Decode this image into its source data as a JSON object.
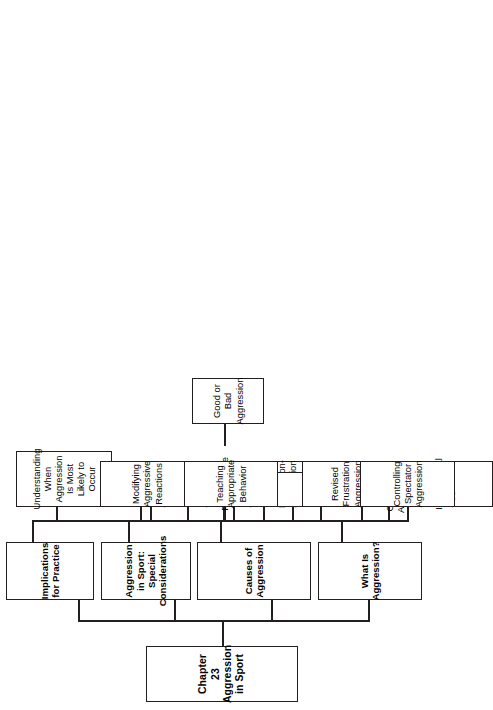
{
  "diagram": {
    "type": "tree",
    "orientation": "rotated-90-ccw",
    "line_color": "#231f20",
    "box_fill": "#ffffff",
    "root": {
      "id": "root",
      "line1": "Chapter 23",
      "line2": "Aggression in Sport"
    },
    "branches": [
      {
        "id": "what-is-aggression",
        "label": "What Is Aggression?",
        "children": [
          {
            "id": "criteria-for-aggression",
            "line1": "Criteria for Aggression",
            "line2": ""
          },
          {
            "id": "hostile-versus-instrumental-aggression",
            "line1": "Hostile Versus",
            "line2": "Instrumental Aggression"
          }
        ]
      },
      {
        "id": "causes-of-aggression",
        "label": "Causes of Aggression",
        "children": [
          {
            "id": "instinct-theory",
            "line1": "Instinct Theory",
            "line2": ""
          },
          {
            "id": "frustration-aggression-theory",
            "line1": "Frustration-Aggression",
            "line2": "Theory"
          },
          {
            "id": "social-learning-theory",
            "line1": "Social Learning Theory",
            "line2": ""
          },
          {
            "id": "revised-frustration-aggression-theory",
            "line1": "Revised Frustration",
            "line2": "Aggression Theory"
          }
        ]
      },
      {
        "id": "aggression-in-sport-special-considerations",
        "label_line1": "Aggression in Sport:",
        "label_line2": "Special Considerations",
        "children": [
          {
            "id": "spectators-and-aggression",
            "line1": "Spectators &",
            "line2": "Aggression"
          },
          {
            "id": "game-reasoning-and-aggression",
            "line1": "Game Reasoning",
            "line2": "& Aggression"
          },
          {
            "id": "athletic-performance-and-aggression",
            "line1": "Athletic Performance",
            "line2": "& Aggression"
          }
        ]
      },
      {
        "id": "implications-for-practice",
        "label": "Implications for Practice",
        "children": [
          {
            "id": "understanding-when-aggression-is-most-likely-to-occur",
            "line1": "Understanding When",
            "line2": "Aggression Is Most",
            "line3": "Likely to Occur"
          },
          {
            "id": "modifying-aggressive-reactions",
            "line1": "Modifying",
            "line2": "Aggressive Reactions"
          },
          {
            "id": "teaching-appropriate-behavior",
            "line1": "Teaching",
            "line2": "Appropriate Behavior",
            "children": [
              {
                "id": "good-or-bad-aggression",
                "line1": "Good or Bad",
                "line2": "Aggression"
              }
            ]
          },
          {
            "id": "controlling-spectator-aggression",
            "line1": "Controlling Spectator",
            "line2": "Aggression"
          }
        ]
      }
    ]
  }
}
